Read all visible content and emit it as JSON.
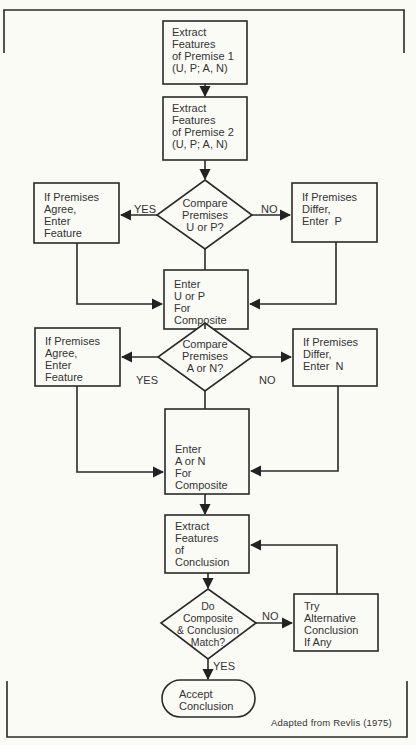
{
  "diagram": {
    "type": "flowchart",
    "credit": "Adapted from Revlis (1975)",
    "nodes": {
      "extract_p1": "Extract\nFeatures\nof Premise 1\n(U, P; A, N)",
      "extract_p2": "Extract\nFeatures\nof Premise 2\n(U, P; A, N)",
      "compare_up": "Compare\nPremises\nU or P?",
      "agree_1": "If Premises\nAgree,\nEnter\nFeature",
      "differ_p": "If Premises\nDiffer,\nEnter  P",
      "enter_up": "Enter\nU or P\nFor\nComposite",
      "compare_an": "Compare\nPremises\nA or N?",
      "agree_2": "If Premises\nAgree,\nEnter\nFeature",
      "differ_n": "If Premises\nDiffer,\nEnter  N",
      "enter_an": "Enter\nA or N\nFor\nComposite",
      "extract_conc": "Extract\nFeatures\nof\nConclusion",
      "match": "Do\nComposite\n& Conclusion\nMatch?",
      "try_alt": "Try\nAlternative\nConclusion\nIf Any",
      "accept": "Accept\nConclusion"
    },
    "edge_labels": {
      "yes_1": "YES",
      "no_1": "NO",
      "yes_2": "YES",
      "no_2": "NO",
      "no_3": "NO",
      "yes_3": "YES"
    },
    "edges": [
      [
        "extract_p1",
        "extract_p2",
        ""
      ],
      [
        "extract_p2",
        "compare_up",
        ""
      ],
      [
        "compare_up",
        "agree_1",
        "YES"
      ],
      [
        "compare_up",
        "differ_p",
        "NO"
      ],
      [
        "compare_up",
        "enter_up",
        ""
      ],
      [
        "agree_1",
        "enter_up",
        ""
      ],
      [
        "differ_p",
        "enter_up",
        ""
      ],
      [
        "enter_up",
        "compare_an",
        ""
      ],
      [
        "compare_an",
        "agree_2",
        "YES"
      ],
      [
        "compare_an",
        "differ_n",
        "NO"
      ],
      [
        "compare_an",
        "enter_an",
        ""
      ],
      [
        "agree_2",
        "enter_an",
        ""
      ],
      [
        "differ_n",
        "enter_an",
        ""
      ],
      [
        "enter_an",
        "extract_conc",
        ""
      ],
      [
        "extract_conc",
        "match",
        ""
      ],
      [
        "match",
        "try_alt",
        "NO"
      ],
      [
        "try_alt",
        "extract_conc",
        ""
      ],
      [
        "match",
        "accept",
        "YES"
      ]
    ]
  }
}
